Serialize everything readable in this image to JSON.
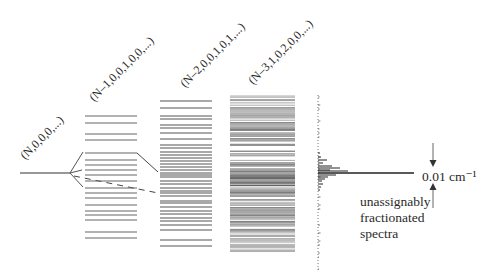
{
  "labels": {
    "state0": "(N,0,0,0,...)",
    "state1": "(N–1,0,0,1,0,0,...)",
    "state2": "(N–2,0,0,1,0,1,...)",
    "state3": "(N–3,1,0,2,0,0,...)",
    "width": "0.01 cm⁻¹",
    "note_line1": "unassignably",
    "note_line2": "fractionated",
    "note_line3": "spectra"
  },
  "colors": {
    "line": "#555555",
    "dark": "#222222",
    "text": "#2a2a2a"
  },
  "diagram": {
    "bright_state": {
      "x1": 20,
      "x2": 70,
      "y": 173
    },
    "stacks": [
      {
        "name": "tier-1",
        "x1": 85,
        "x2": 137,
        "levels": [
          116,
          123,
          134,
          140,
          153,
          160,
          165,
          170,
          175,
          181,
          188,
          193,
          198,
          205,
          211,
          215,
          220,
          232,
          238
        ]
      },
      {
        "name": "tier-2",
        "x1": 160,
        "x2": 212,
        "levels": [
          101,
          108,
          116,
          119,
          125,
          128,
          133,
          139,
          145,
          148,
          152,
          155,
          158,
          161,
          164,
          167,
          170,
          173,
          175,
          177,
          181,
          184,
          188,
          191,
          193,
          196,
          201,
          203,
          207,
          211,
          214,
          218,
          221,
          225,
          230,
          240,
          246
        ]
      },
      {
        "name": "tier-3",
        "x1": 230,
        "x2": 295,
        "levels_from": 96,
        "levels_to": 252
      }
    ],
    "spectrum": {
      "axis_x": 318,
      "y_top": 95,
      "y_bottom": 272,
      "main_peak": {
        "y": 173,
        "x_end": 414
      },
      "peaks": [
        {
          "y": 160,
          "len": 9
        },
        {
          "y": 163,
          "len": 5
        },
        {
          "y": 166,
          "len": 14
        },
        {
          "y": 168,
          "len": 22
        },
        {
          "y": 170,
          "len": 12
        },
        {
          "y": 171,
          "len": 30
        },
        {
          "y": 175,
          "len": 18
        },
        {
          "y": 177,
          "len": 10
        },
        {
          "y": 179,
          "len": 7
        },
        {
          "y": 181,
          "len": 4
        },
        {
          "y": 184,
          "len": 5
        },
        {
          "y": 157,
          "len": 3
        },
        {
          "y": 153,
          "len": 2
        },
        {
          "y": 187,
          "len": 3
        },
        {
          "y": 190,
          "len": 2
        }
      ]
    }
  }
}
